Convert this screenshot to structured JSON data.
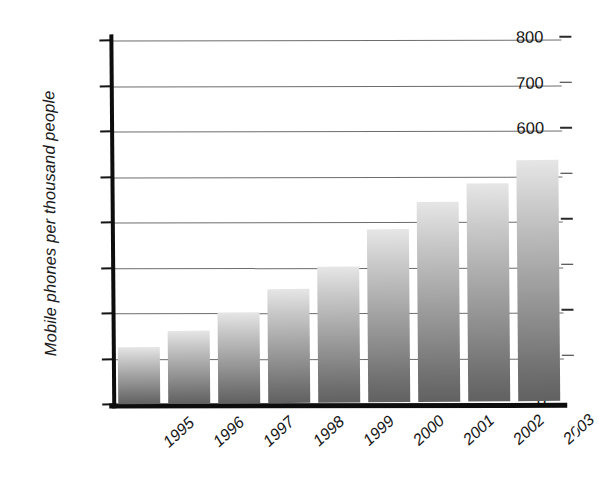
{
  "chart_data": {
    "type": "bar",
    "title": "",
    "xlabel": "",
    "ylabel": "Mobile phones per thousand people",
    "categories": [
      "1995",
      "1996",
      "1997",
      "1998",
      "1999",
      "2000",
      "2001",
      "2002",
      "2003"
    ],
    "values": [
      125,
      160,
      200,
      250,
      300,
      380,
      440,
      480,
      530
    ],
    "ylim": [
      0,
      800
    ],
    "ytick_labels": [
      "0",
      "100",
      "200",
      "300",
      "400",
      "500",
      "600",
      "700",
      "800"
    ],
    "ytick_values": [
      0,
      100,
      200,
      300,
      400,
      500,
      600,
      700,
      800
    ],
    "grid": "horizontal",
    "legend": "none",
    "bar_fill": "gray-vertical-gradient",
    "colors": {
      "axis": "#0d0d0d",
      "gridline": "#6d6d6d",
      "bar_top": "#e6e6e6",
      "bar_bottom": "#616161",
      "text": "#161616",
      "background": "#ffffff"
    }
  }
}
